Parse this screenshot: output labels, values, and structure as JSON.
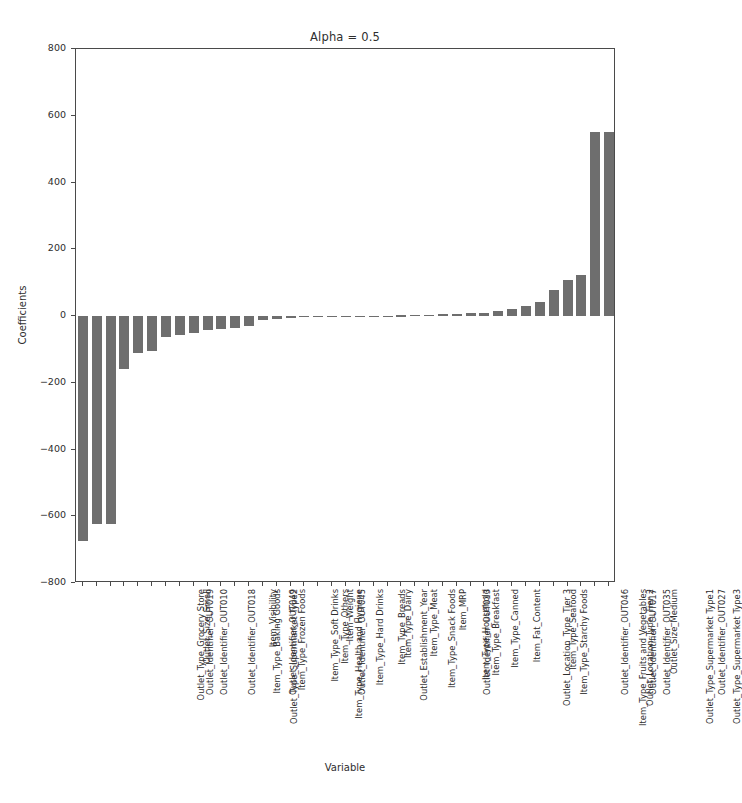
{
  "chart_data": {
    "type": "bar",
    "title": "Alpha = 0.5",
    "xlabel": "Variable",
    "ylabel": "Coefficients",
    "ylim": [
      -800,
      800
    ],
    "yticks": [
      800,
      600,
      400,
      200,
      0,
      -200,
      -400,
      -600,
      -800
    ],
    "grid": false,
    "legend": null,
    "bar_color": "#6e6e6e",
    "categories": [
      "Outlet_Type_Grocery Store",
      "Outlet_Identifier_OUT019",
      "Outlet_Identifier_OUT010",
      "Outlet_Size_Small",
      "Outlet_Identifier_OUT018",
      "Outlet_Type_Supermarket Type2",
      "Item_Type_Baking Goods",
      "Outlet_Identifier_OUT049",
      "Item_Type_Frozen Foods",
      "Item_Visibility",
      "Item_Type_Health and Hygiene",
      "Item_Type_Soft Drinks",
      "Outlet_Identifier_OUT045",
      "Item_Type_Others",
      "Item_Type_Hard Drinks",
      "Item_Weight",
      "Outlet_Establishment_Year",
      "Item_Type_Breads",
      "Item_Type_Dairy",
      "Item_Type_Snack Foods",
      "Item_Type_Meat",
      "Outlet_Identifier_OUT013",
      "Item_Type_Household",
      "Item_Type_Breakfast",
      "Item_MRP",
      "Item_Type_Canned",
      "Outlet_Location_Type_Tier 3",
      "Item_Fat_Content",
      "Item_Type_Starchy Foods",
      "Item_Type_Seafood",
      "Item_Type_Fruits and Vegetables",
      "Outlet_Identifier_OUT046",
      "Outlet_Location_Type_Tier 2",
      "Outlet_Identifier_OUT017",
      "Outlet_Identifier_OUT035",
      "Outlet_Type_Supermarket Type1",
      "Outlet_Size_Medium",
      "Outlet_Type_Supermarket Type3",
      "Outlet_Identifier_OUT027"
    ],
    "values": [
      -673,
      -622,
      -622,
      -160,
      -112,
      -104,
      -62,
      -56,
      -50,
      -42,
      -40,
      -36,
      -30,
      -12,
      -8,
      -5,
      -3,
      -2,
      -2,
      -1,
      -1,
      0,
      1,
      2,
      3,
      4,
      5,
      6,
      8,
      10,
      14,
      20,
      30,
      42,
      78,
      108,
      124,
      132,
      170
    ],
    "values_tail_note": "last two bars ~550",
    "values_override": {
      "37": 550,
      "38": 552
    }
  }
}
